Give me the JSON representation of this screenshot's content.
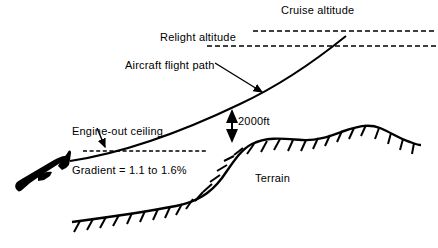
{
  "diagram": {
    "labels": {
      "cruise_altitude": "Cruise altitude",
      "relight_altitude": "Relight altitude",
      "flight_path": "Aircraft flight path",
      "engine_out_line1": "Engine-out ceiling",
      "engine_out_line2": "Gradient = 1.1 to 1.6%",
      "clearance": "2000ft",
      "terrain": "Terrain"
    },
    "colors": {
      "stroke": "#000000",
      "background": "#ffffff",
      "aircraft_fill": "#000000"
    },
    "elements": {
      "cruise_altitude_line": "dashed-horizontal",
      "relight_altitude_line": "dashed-horizontal",
      "engine_out_ceiling_line": "dashed-horizontal",
      "flight_path_line": "solid-curve-ascending",
      "terrain_profile": "solid-curve-hachured",
      "clearance_arrow": "double-headed-vertical-arrow",
      "aircraft": "aircraft-silhouette"
    }
  }
}
